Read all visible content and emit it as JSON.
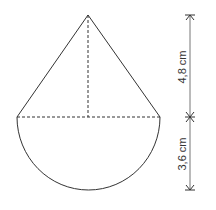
{
  "figure": {
    "dimensions": [
      {
        "label": "4,8 cm",
        "refers_to": "cone height"
      },
      {
        "label": "3,6 cm",
        "refers_to": "semicircle radius"
      }
    ],
    "colors": {
      "outline": "#333333",
      "dimension_line": "#555555",
      "background": "#ffffff"
    }
  }
}
